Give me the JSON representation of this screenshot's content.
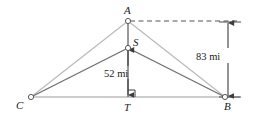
{
  "figure": {
    "kind": "geometry-diagram",
    "title_text": "",
    "colors": {
      "outer_triangle_line": "#b8b8b8",
      "inner_triangle_line": "#6e6e6e",
      "baseline": "#9a9a9a",
      "vertical_line": "#555555",
      "dashed_line": "#555555",
      "dimension_line": "#4a4a4a",
      "node_stroke": "#5a5a5a",
      "node_fill": "#ffffff",
      "text": "#1c1c1c",
      "background": "#ffffff"
    },
    "points": [
      {
        "id": "A",
        "label": "A",
        "x": 128,
        "y": 21,
        "label_x": 124,
        "label_y": 5
      },
      {
        "id": "S",
        "label": "S",
        "x": 128,
        "y": 48,
        "label_x": 133,
        "label_y": 37
      },
      {
        "id": "T",
        "label": "T",
        "x": 128,
        "y": 97,
        "label_x": 124,
        "label_y": 102
      },
      {
        "id": "C",
        "label": "C",
        "x": 31,
        "y": 97,
        "label_x": 16,
        "label_y": 100
      },
      {
        "id": "B",
        "label": "B",
        "x": 225,
        "y": 97,
        "label_x": 224,
        "label_y": 101
      }
    ],
    "segments": [
      {
        "id": "C-A",
        "from": "C",
        "to": "A",
        "style": "solid",
        "weight": "light"
      },
      {
        "id": "A-B",
        "from": "A",
        "to": "B",
        "style": "solid",
        "weight": "light"
      },
      {
        "id": "C-S",
        "from": "C",
        "to": "S",
        "style": "solid",
        "weight": "dark"
      },
      {
        "id": "S-B",
        "from": "S",
        "to": "B",
        "style": "solid",
        "weight": "dark"
      },
      {
        "id": "A-T",
        "from": "A",
        "to": "T",
        "style": "solid",
        "weight": "vertical"
      }
    ],
    "baseline": {
      "x1": 31,
      "x2": 240,
      "y": 97
    },
    "dashed_guide": {
      "x1": 128,
      "x2": 240,
      "y": 21
    },
    "right_angle_marker": {
      "x": 128,
      "y": 97,
      "size": 7,
      "side": "right"
    },
    "dimensions": [
      {
        "id": "dim-52",
        "label": "52 mi",
        "value": 52,
        "unit": "mi",
        "orientation": "vertical",
        "x": 128,
        "y_top": 50,
        "y_bottom": 95,
        "label_x": 104,
        "label_y": 69,
        "arrows": "both",
        "measures": "S to T"
      },
      {
        "id": "dim-83",
        "label": "83 mi",
        "value": 83,
        "unit": "mi",
        "orientation": "vertical",
        "x": 228,
        "y_top": 22,
        "y_bottom": 96,
        "label_x": 196,
        "label_y": 52,
        "arrows": "both",
        "measures": "A-level to B-level"
      }
    ],
    "tick_caps": [
      {
        "id": "cap-top",
        "x1": 220,
        "x2": 240,
        "y": 22
      },
      {
        "id": "cap-bottom",
        "x1": 220,
        "x2": 240,
        "y": 97
      }
    ]
  }
}
